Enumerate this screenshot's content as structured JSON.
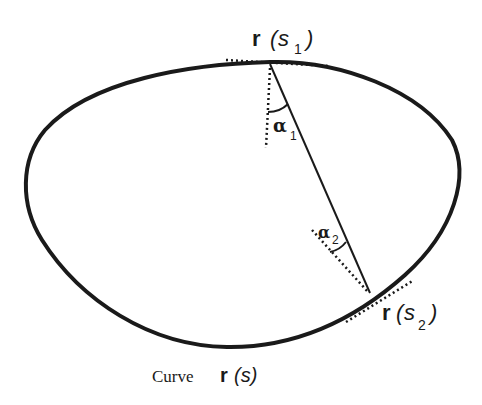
{
  "diagram": {
    "type": "geometry-figure",
    "colors": {
      "stroke": "#1a1a1a",
      "background": "#ffffff"
    },
    "labels": {
      "point1": {
        "r": "r",
        "open": "(",
        "s": "s",
        "sub": "1",
        "close": ")"
      },
      "point2": {
        "r": "r",
        "open": "(",
        "s": "s",
        "sub": "2",
        "close": ")"
      },
      "angle1": {
        "symbol": "α",
        "sub": "1"
      },
      "angle2": {
        "symbol": "α",
        "sub": "2"
      },
      "caption": {
        "word": "Curve",
        "r": "r",
        "s": "(s)"
      }
    },
    "elements": [
      "closed curve r(s)",
      "chord from r(s1) to r(s2)",
      "tangent line at r(s1) (dotted)",
      "tangent line at r(s2) (dotted)",
      "normal line at r(s1) (dotted)",
      "normal line at r(s2) (dotted)",
      "angle arc alpha1",
      "angle arc alpha2"
    ]
  }
}
